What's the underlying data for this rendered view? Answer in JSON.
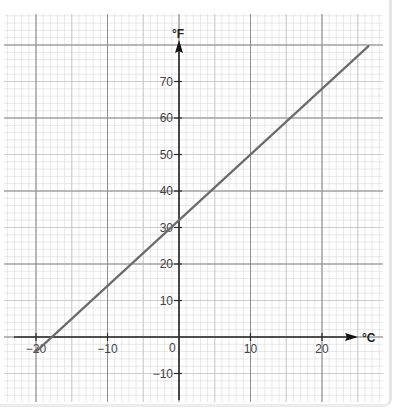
{
  "chart_data": {
    "type": "line",
    "title": "",
    "xlabel": "°C",
    "ylabel": "°F",
    "x_ticks": [
      -20,
      -10,
      0,
      10,
      20
    ],
    "x_tick_labels": [
      "−20",
      "−10",
      "0",
      "10",
      "20"
    ],
    "y_ticks": [
      -10,
      10,
      20,
      30,
      40,
      50,
      60,
      70
    ],
    "y_tick_labels": [
      "−10",
      "10",
      "20",
      "30",
      "40",
      "50",
      "60",
      "70"
    ],
    "origin_label": "0",
    "xlim": [
      -22,
      28
    ],
    "ylim": [
      -18,
      88
    ],
    "grid": true,
    "grid_minor_step_x": 1,
    "grid_minor_step_y": 2,
    "grid_major_step_x": 10,
    "grid_major_step_y": 20,
    "legend": null,
    "series": [
      {
        "name": "F = 1.8C + 32",
        "x": [
          -20,
          26.5
        ],
        "y": [
          -4,
          79.7
        ],
        "color": "#6b6b6b"
      }
    ]
  },
  "colors": {
    "minor_grid": "#d9d9d9",
    "major_grid": "#8f8f8f",
    "axis": "#2b2b2b",
    "line": "#6b6b6b"
  }
}
